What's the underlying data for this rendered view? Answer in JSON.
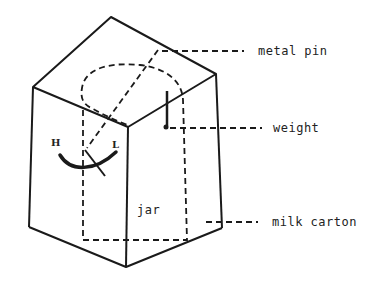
{
  "diagram": {
    "labels": {
      "metal_pin": "metal pin",
      "weight": "weight",
      "milk_carton": "milk carton",
      "jar": "jar",
      "high": "H",
      "low": "L"
    },
    "colors": {
      "line": "#1a1a1a",
      "background": "#ffffff"
    }
  }
}
